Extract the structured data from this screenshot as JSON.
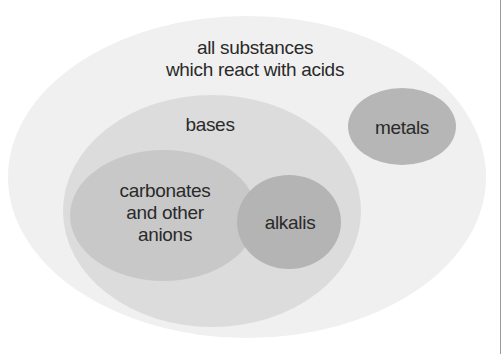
{
  "diagram": {
    "type": "nested-venn",
    "sets": {
      "outer": {
        "label_line1": "all substances",
        "label_line2": "which react with acids",
        "color": "#f0f0f0"
      },
      "bases": {
        "label": "bases",
        "color": "#dcdcdc"
      },
      "carbonates": {
        "label_line1": "carbonates",
        "label_line2": "and other",
        "label_line3": "anions",
        "color": "#c8c8c8"
      },
      "alkalis": {
        "label": "alkalis",
        "color": "#b4b4b4"
      },
      "metals": {
        "label": "metals",
        "color": "#b6b6b6"
      }
    }
  }
}
